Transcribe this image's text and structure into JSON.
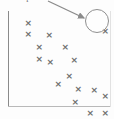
{
  "figure": {
    "caption": "example.",
    "background_color": "#fdfdfd",
    "marker_color": "#6f6f6f",
    "axis_color": "#8a8a8a",
    "annotation_color": "#8f8f8f"
  },
  "annotation": {
    "circle_label": "highlighted-point",
    "circle_center_x": 97,
    "circle_center_y": 21,
    "circle_radius": 12,
    "arrow_from_x": 48,
    "arrow_from_y": 1,
    "arrow_to_x": 84,
    "arrow_to_y": 18,
    "marker_glyph": "×"
  },
  "chart_data": {
    "type": "scatter",
    "title": "",
    "xlabel": "",
    "ylabel": "",
    "grid": false,
    "legend": null,
    "xlim": [
      0,
      104
    ],
    "ylim": [
      0,
      99
    ],
    "marker": "x",
    "series": [
      {
        "name": "observations",
        "points": [
          [
            20,
            13
          ],
          [
            20,
            24
          ],
          [
            41,
            25
          ],
          [
            31,
            37
          ],
          [
            57,
            37
          ],
          [
            31,
            49
          ],
          [
            42,
            52
          ],
          [
            66,
            50
          ],
          [
            50,
            74
          ],
          [
            61,
            66
          ],
          [
            70,
            79
          ],
          [
            86,
            80
          ],
          [
            67,
            92
          ],
          [
            97,
            86
          ],
          [
            82,
            103
          ],
          [
            97,
            103
          ],
          [
            97,
            21
          ]
        ]
      }
    ]
  }
}
